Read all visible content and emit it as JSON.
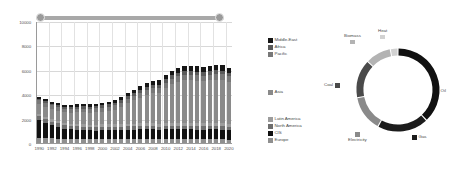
{
  "slider": {
    "name": "year-range-slider",
    "left_handle": "1990",
    "right_handle": "2020",
    "track_color": "#b0b0b0",
    "handle_color": "#9a9a9a"
  },
  "chart_data": [
    {
      "type": "bar",
      "subtype": "stacked",
      "title": "",
      "xlabel": "",
      "ylabel": "",
      "ylim": [
        0,
        10000
      ],
      "yticks": [
        0,
        2000,
        4000,
        6000,
        8000,
        10000
      ],
      "ytick_labels": [
        "0",
        "2000",
        "4000",
        "6000",
        "8000",
        "10000"
      ],
      "grid": true,
      "legend_position": "right",
      "x": [
        1990,
        1991,
        1992,
        1993,
        1994,
        1995,
        1996,
        1997,
        1998,
        1999,
        2000,
        2001,
        2002,
        2003,
        2004,
        2005,
        2006,
        2007,
        2008,
        2009,
        2010,
        2011,
        2012,
        2013,
        2014,
        2015,
        2016,
        2017,
        2018,
        2019,
        2020
      ],
      "xtick_labels": [
        "1990",
        "1992",
        "1994",
        "1996",
        "1998",
        "2000",
        "2002",
        "2004",
        "2006",
        "2008",
        "2010",
        "2012",
        "2014",
        "2016",
        "2018",
        "2020"
      ],
      "categories": [
        "1990",
        "1991",
        "1992",
        "1993",
        "1994",
        "1995",
        "1996",
        "1997",
        "1998",
        "1999",
        "2000",
        "2001",
        "2002",
        "2003",
        "2004",
        "2005",
        "2006",
        "2007",
        "2008",
        "2009",
        "2010",
        "2011",
        "2012",
        "2013",
        "2014",
        "2015",
        "2016",
        "2017",
        "2018",
        "2019",
        "2020"
      ],
      "series": [
        {
          "name": "Europe",
          "color": "#8f8f8f",
          "values": [
            420,
            400,
            380,
            360,
            350,
            350,
            350,
            345,
            340,
            335,
            330,
            325,
            320,
            320,
            320,
            320,
            320,
            320,
            315,
            300,
            310,
            305,
            300,
            300,
            300,
            300,
            300,
            300,
            300,
            290,
            270
          ]
        },
        {
          "name": "CIS",
          "color": "#111111",
          "values": [
            1450,
            1280,
            1080,
            950,
            830,
            760,
            730,
            700,
            690,
            690,
            700,
            710,
            720,
            740,
            760,
            780,
            790,
            800,
            810,
            780,
            810,
            820,
            820,
            820,
            810,
            800,
            800,
            810,
            820,
            810,
            770
          ]
        },
        {
          "name": "North America",
          "color": "#6e6e6e",
          "values": [
            310,
            300,
            300,
            295,
            290,
            290,
            290,
            290,
            290,
            290,
            290,
            285,
            285,
            285,
            285,
            285,
            285,
            285,
            280,
            270,
            275,
            275,
            275,
            275,
            275,
            275,
            275,
            275,
            275,
            270,
            255
          ]
        },
        {
          "name": "Latin America",
          "color": "#9c9c9c",
          "values": [
            180,
            180,
            180,
            180,
            185,
            185,
            190,
            195,
            195,
            195,
            200,
            200,
            200,
            205,
            210,
            215,
            220,
            225,
            230,
            225,
            235,
            240,
            245,
            245,
            245,
            245,
            245,
            245,
            245,
            240,
            225
          ]
        },
        {
          "name": "Asia",
          "color": "#8a8a8a",
          "values": [
            830,
            830,
            840,
            850,
            870,
            900,
            950,
            980,
            980,
            1000,
            1060,
            1120,
            1220,
            1420,
            1680,
            1900,
            2100,
            2300,
            2450,
            2550,
            2900,
            3200,
            3400,
            3500,
            3500,
            3480,
            3450,
            3500,
            3560,
            3560,
            3500
          ]
        },
        {
          "name": "Pacific",
          "color": "#787878",
          "values": [
            300,
            300,
            300,
            300,
            305,
            310,
            315,
            320,
            320,
            325,
            330,
            335,
            340,
            350,
            360,
            375,
            390,
            400,
            410,
            405,
            420,
            430,
            440,
            445,
            450,
            450,
            450,
            455,
            460,
            460,
            440
          ]
        },
        {
          "name": "Africa",
          "color": "#5a5a5a",
          "values": [
            160,
            160,
            160,
            160,
            165,
            165,
            170,
            175,
            175,
            180,
            185,
            190,
            195,
            205,
            215,
            225,
            235,
            245,
            255,
            255,
            270,
            280,
            290,
            295,
            300,
            300,
            300,
            305,
            310,
            310,
            295
          ]
        },
        {
          "name": "Middle-East",
          "color": "#161616",
          "values": [
            140,
            145,
            150,
            155,
            160,
            165,
            175,
            180,
            185,
            190,
            200,
            210,
            220,
            240,
            260,
            280,
            300,
            320,
            340,
            345,
            370,
            390,
            410,
            420,
            430,
            430,
            430,
            440,
            450,
            450,
            430
          ]
        }
      ]
    },
    {
      "type": "pie",
      "subtype": "donut",
      "title": "",
      "legend_position": "around",
      "labels": [
        "Oil",
        "Gas",
        "Electricity",
        "Coal",
        "Biomass",
        "Heat"
      ],
      "values": [
        38,
        20,
        14,
        15,
        10,
        3
      ],
      "colors": [
        "#111111",
        "#1c1c1c",
        "#8a8a8a",
        "#4a4a4a",
        "#b3b3b3",
        "#d2d2d2"
      ]
    }
  ],
  "bar_legend": {
    "items": [
      {
        "label": "Middle-East",
        "color": "#161616",
        "top": 0
      },
      {
        "label": "Africa",
        "color": "#5a5a5a",
        "top": 7
      },
      {
        "label": "Pacific",
        "color": "#787878",
        "top": 14
      },
      {
        "label": "Asia",
        "color": "#8a8a8a",
        "top": 52
      },
      {
        "label": "Latin America",
        "color": "#9c9c9c",
        "top": 79
      },
      {
        "label": "North America",
        "color": "#6e6e6e",
        "top": 86
      },
      {
        "label": "CIS",
        "color": "#111111",
        "top": 93
      },
      {
        "label": "Europe",
        "color": "#8f8f8f",
        "top": 100
      }
    ]
  },
  "donut_labels": {
    "oil": {
      "label": "Oil",
      "color": "#111111"
    },
    "gas": {
      "label": "Gas",
      "color": "#1c1c1c"
    },
    "electricity": {
      "label": "Electricity",
      "color": "#8a8a8a"
    },
    "coal": {
      "label": "Coal",
      "color": "#4a4a4a"
    },
    "biomass": {
      "label": "Biomass",
      "color": "#b3b3b3"
    },
    "heat": {
      "label": "Heat",
      "color": "#d2d2d2"
    }
  }
}
